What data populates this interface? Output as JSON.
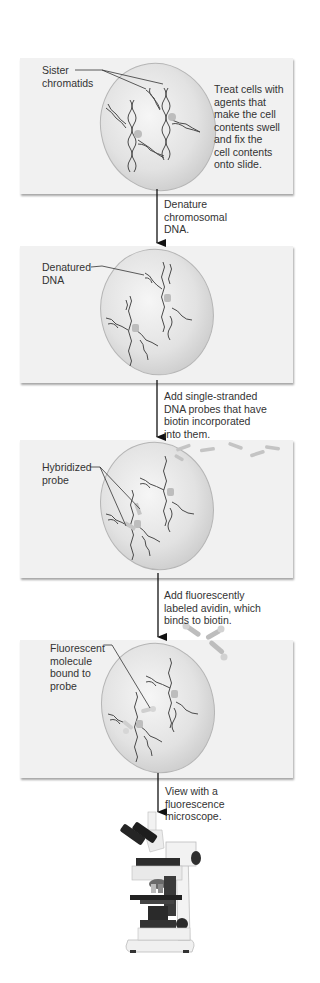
{
  "panels": [
    {
      "id": 1,
      "label": "Sister\nchromatids",
      "side_text": "Treat cells with\nagents that\nmake the cell\ncontents swell\nand fix the\ncell contents\nonto slide."
    },
    {
      "id": 2,
      "label": "Denatured\nDNA"
    },
    {
      "id": 3,
      "label": "Hybridized\nprobe"
    },
    {
      "id": 4,
      "label": "Fluorescent\nmolecule\nbound to\nprobe"
    }
  ],
  "steps": [
    {
      "text": "Denature\nchromosomal\nDNA."
    },
    {
      "text": "Add single-stranded\nDNA probes that have\nbiotin incorporated\ninto them."
    },
    {
      "text": "Add fluorescently\nlabeled avidin, which\nbinds to biotin."
    },
    {
      "text": "View with a\nfluorescence\nmicroscope."
    }
  ],
  "colors": {
    "panel_bg": "#f1f1f1",
    "cell_fill": "#e4e4e4",
    "cell_edge": "#b5b5b5",
    "dna": "#4a4a4a",
    "probe": "#bdbdbd",
    "arrow": "#111111"
  }
}
